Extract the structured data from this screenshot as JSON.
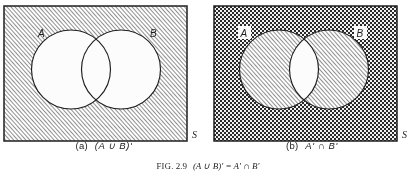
{
  "figure": {
    "label": "FIG.",
    "number": "2.9",
    "caption_expression": "(A ∪ B)' = A' ∩ B'",
    "caption_full": "FIG. 2.9  (A ∪ B)' = A' ∩ B'",
    "ink_color": "#1b1b1b",
    "paper_color": "#ffffff"
  },
  "panels": [
    {
      "id": "a",
      "tag": "(a)",
      "expression": "(A ∪ B)'",
      "set_label_a": "A",
      "set_label_b": "B",
      "universe_label": "S",
      "universe_fill": "diagonal-hatch",
      "circle_a_fill": "white",
      "circle_b_fill": "white",
      "lens_fill": "white",
      "shaded_region": "outside both circles"
    },
    {
      "id": "b",
      "tag": "(b)",
      "expression": "A' ∩ B'",
      "set_label_a": "A",
      "set_label_b": "B",
      "universe_label": "S",
      "universe_fill": "checkerboard-stipple",
      "circle_a_fill": "diagonal-hatch",
      "circle_b_fill": "diagonal-hatch",
      "lens_fill": "white",
      "shaded_region": "outside both circles"
    }
  ]
}
